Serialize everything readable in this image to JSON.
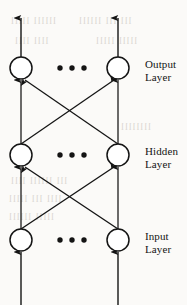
{
  "figure": {
    "kind": "neural-network-architecture-diagram",
    "width": 187,
    "height": 305,
    "background_color": "#fbfaf8",
    "ink_color": "#141414",
    "node_fill_color": "#ffffff"
  },
  "layers": [
    {
      "id": "output",
      "label_line1": "Output",
      "label_line2": "Layer",
      "label_x": 145,
      "label_y": 58,
      "center_y": 68,
      "ellipsis": "• • •",
      "nodes": [
        {
          "cx": 21,
          "cy": 68,
          "r": 11
        },
        {
          "cx": 118,
          "cy": 68,
          "r": 11
        }
      ]
    },
    {
      "id": "hidden",
      "label_line1": "Hidden",
      "label_line2": "Layer",
      "label_x": 145,
      "label_y": 145,
      "center_y": 155,
      "ellipsis": "• • •",
      "nodes": [
        {
          "cx": 21,
          "cy": 155,
          "r": 11
        },
        {
          "cx": 118,
          "cy": 155,
          "r": 11
        }
      ]
    },
    {
      "id": "input",
      "label_line1": "Input",
      "label_line2": "Layer",
      "label_x": 145,
      "label_y": 230,
      "center_y": 240,
      "ellipsis": "• • •",
      "nodes": [
        {
          "cx": 21,
          "cy": 240,
          "r": 11
        },
        {
          "cx": 118,
          "cy": 240,
          "r": 11
        }
      ]
    }
  ],
  "ellipsis_x": 72,
  "external_arrows": {
    "outputs": [
      {
        "x": 21,
        "y_from": 57,
        "y_to": 18
      },
      {
        "x": 118,
        "y_from": 57,
        "y_to": 18
      }
    ],
    "inputs": [
      {
        "x": 21,
        "y_from": 305,
        "y_to": 252
      },
      {
        "x": 118,
        "y_from": 305,
        "y_to": 252
      }
    ]
  },
  "connections": {
    "hidden_to_output": [
      {
        "from_x": 21,
        "from_y": 144,
        "to_x": 21,
        "to_y": 80,
        "type": "vertical"
      },
      {
        "from_x": 118,
        "from_y": 144,
        "to_x": 118,
        "to_y": 80,
        "type": "vertical"
      },
      {
        "from_x": 21,
        "from_y": 144,
        "to_x": 114,
        "to_y": 80,
        "type": "cross"
      },
      {
        "from_x": 118,
        "from_y": 144,
        "to_x": 25,
        "to_y": 80,
        "type": "cross"
      }
    ],
    "input_to_hidden": [
      {
        "from_x": 21,
        "from_y": 229,
        "to_x": 21,
        "to_y": 167,
        "type": "vertical"
      },
      {
        "from_x": 118,
        "from_y": 229,
        "to_x": 118,
        "to_y": 167,
        "type": "vertical"
      },
      {
        "from_x": 21,
        "from_y": 229,
        "to_x": 114,
        "to_y": 167,
        "type": "cross"
      },
      {
        "from_x": 118,
        "from_y": 229,
        "to_x": 25,
        "to_y": 167,
        "type": "cross"
      }
    ]
  },
  "bleed_through": [
    {
      "text": "llllll lllll",
      "x": 10,
      "y": 16
    },
    {
      "text": "lll lll llllll",
      "x": 78,
      "y": 16
    },
    {
      "text": "llll llll",
      "x": 14,
      "y": 36
    },
    {
      "text": "lllll lllll",
      "x": 95,
      "y": 36
    },
    {
      "text": "llllllll",
      "x": 120,
      "y": 122
    },
    {
      "text": "lll llllll llll",
      "x": 10,
      "y": 176
    },
    {
      "text": "llll lll lllll",
      "x": 8,
      "y": 194
    },
    {
      "text": "lllll llllll",
      "x": 8,
      "y": 212
    }
  ]
}
